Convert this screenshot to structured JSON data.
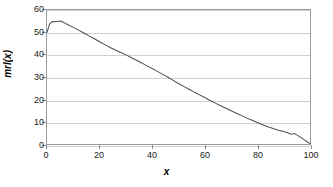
{
  "chart_data": {
    "type": "line",
    "title": "",
    "xlabel": "x",
    "ylabel": "mrl(x)",
    "xlim": [
      0,
      100
    ],
    "ylim": [
      0,
      60
    ],
    "xticks": [
      0,
      20,
      40,
      60,
      80,
      100
    ],
    "yticks": [
      0,
      10,
      20,
      30,
      40,
      50,
      60
    ],
    "xtick_labels": [
      "0",
      "20",
      "40",
      "60",
      "80",
      "100"
    ],
    "ytick_labels": [
      "0",
      "10",
      "20",
      "30",
      "40",
      "50",
      "60"
    ],
    "grid": "horizontal",
    "legend": "none",
    "line_color": "#4d4d4d",
    "frame_color": "#9a9a9a",
    "grid_color": "#d0d0d0",
    "series": [
      {
        "name": "mrl(x)",
        "x": [
          0,
          1,
          2,
          3,
          4,
          5,
          6,
          7,
          8,
          9,
          10,
          12,
          14,
          16,
          18,
          20,
          22,
          24,
          26,
          28,
          30,
          32,
          34,
          36,
          38,
          40,
          42,
          44,
          46,
          48,
          50,
          52,
          54,
          56,
          58,
          60,
          62,
          64,
          66,
          68,
          70,
          72,
          74,
          76,
          78,
          80,
          82,
          84,
          86,
          88,
          90,
          92,
          93,
          94,
          95,
          96,
          97,
          98,
          99,
          100
        ],
        "y": [
          50.0,
          53.8,
          54.8,
          54.7,
          54.9,
          55.1,
          54.6,
          54.0,
          53.4,
          52.8,
          52.2,
          51.0,
          49.7,
          48.4,
          47.1,
          45.8,
          44.5,
          43.2,
          42.1,
          41.0,
          39.9,
          38.7,
          37.5,
          36.3,
          35.0,
          33.8,
          32.5,
          31.2,
          29.9,
          28.5,
          27.1,
          25.8,
          24.5,
          23.2,
          22.0,
          20.8,
          19.5,
          18.3,
          17.1,
          16.0,
          14.9,
          13.8,
          12.7,
          11.6,
          10.6,
          9.6,
          8.6,
          7.7,
          6.9,
          6.2,
          5.6,
          4.8,
          4.3,
          4.7,
          4.1,
          3.3,
          2.5,
          1.7,
          0.9,
          0.2
        ]
      }
    ]
  },
  "axes": {
    "y_title": "mrl(x)",
    "x_title": "x"
  }
}
